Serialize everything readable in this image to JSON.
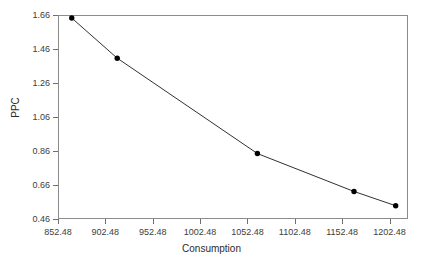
{
  "chart_data": {
    "type": "line",
    "title": "",
    "xlabel": "Consumption",
    "ylabel": "PPC",
    "xlim": [
      852.48,
      1222.0
    ],
    "ylim": [
      0.46,
      1.66
    ],
    "grid": false,
    "legend": "none",
    "marker": "filled-circle",
    "line_color": "#1a1a1a",
    "marker_color": "#000000",
    "frame_color": "#8c8c8c",
    "xticks": [
      852.48,
      902.48,
      952.48,
      1002.48,
      1052.48,
      1102.48,
      1152.48,
      1202.48
    ],
    "xtick_labels": [
      "852.48",
      "902.48",
      "952.48",
      "1002.48",
      "1052.48",
      "1102.48",
      "1152.48",
      "1202.48"
    ],
    "yticks": [
      0.46,
      0.66,
      0.86,
      1.06,
      1.26,
      1.46,
      1.66
    ],
    "ytick_labels": [
      "0.46",
      "0.66",
      "0.86",
      "1.06",
      "1.26",
      "1.46",
      "1.66"
    ],
    "series": [
      {
        "name": "PPC vs Consumption",
        "x": [
          867.0,
          915.0,
          1063.0,
          1165.0,
          1209.0
        ],
        "y": [
          1.642,
          1.406,
          0.845,
          0.622,
          0.538
        ]
      }
    ]
  }
}
